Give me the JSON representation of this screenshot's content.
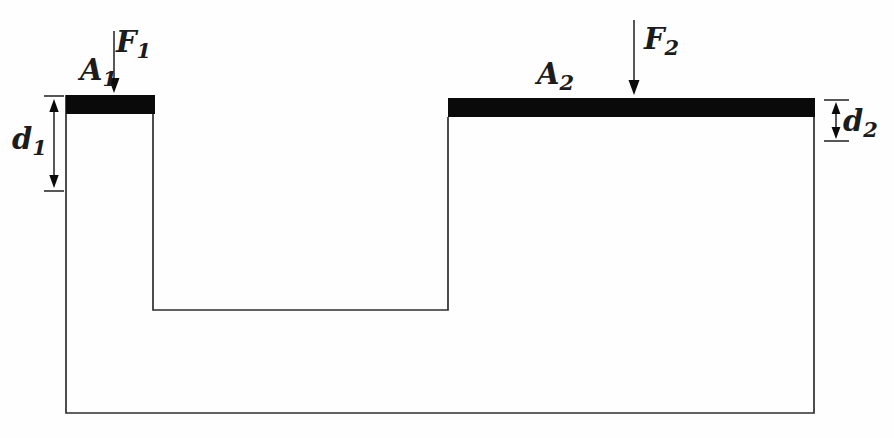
{
  "figure": {
    "kind": "hydraulic-lift-cross-section",
    "colors": {
      "line": "#2e2e2e",
      "piston": "#0a0a0a",
      "text": "#1c1c1c",
      "background": "#fefefe"
    },
    "labels": {
      "f1": {
        "letter": "F",
        "sub": "1"
      },
      "a1": {
        "letter": "A",
        "sub": "1"
      },
      "d1": {
        "letter": "d",
        "sub": "1"
      },
      "f2": {
        "letter": "F",
        "sub": "2"
      },
      "a2": {
        "letter": "A",
        "sub": "2"
      },
      "d2": {
        "letter": "d",
        "sub": "2"
      }
    }
  }
}
